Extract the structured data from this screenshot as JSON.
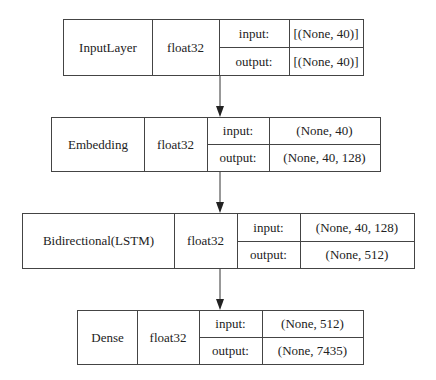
{
  "diagram": {
    "type": "keras_model_plot",
    "nodes": [
      {
        "name": "InputLayer",
        "dtype": "float32",
        "input_label": "input:",
        "input_shape": "[(None, 40)]",
        "output_label": "output:",
        "output_shape": "[(None, 40)]"
      },
      {
        "name": "Embedding",
        "dtype": "float32",
        "input_label": "input:",
        "input_shape": "(None, 40)",
        "output_label": "output:",
        "output_shape": "(None, 40, 128)"
      },
      {
        "name": "Bidirectional(LSTM)",
        "dtype": "float32",
        "input_label": "input:",
        "input_shape": "(None, 40, 128)",
        "output_label": "output:",
        "output_shape": "(None, 512)"
      },
      {
        "name": "Dense",
        "dtype": "float32",
        "input_label": "input:",
        "input_shape": "(None, 512)",
        "output_label": "output:",
        "output_shape": "(None, 7435)"
      }
    ],
    "edges": [
      {
        "from": "InputLayer",
        "to": "Embedding"
      },
      {
        "from": "Embedding",
        "to": "Bidirectional(LSTM)"
      },
      {
        "from": "Bidirectional(LSTM)",
        "to": "Dense"
      }
    ],
    "colors": {
      "line": "#444444",
      "background": "#ffffff",
      "text": "#222222"
    }
  }
}
